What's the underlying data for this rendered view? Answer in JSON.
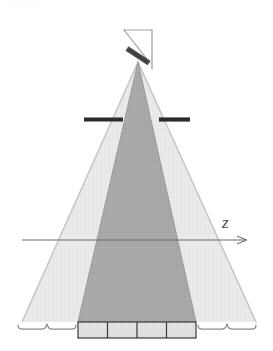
{
  "figure": {
    "name": "ultrasound-beam-geometry-diagram",
    "width": 273,
    "height": 351,
    "background_color": "#ffffff",
    "clipped_header_text": "............"
  },
  "axis": {
    "label": "z",
    "label_x": 222,
    "label_y": 228,
    "line_y": 240,
    "line_x_start": 22,
    "line_x_end": 246,
    "arrow_tip_x": 256,
    "color": "#6b6b6b",
    "stroke_width": 1.1
  },
  "source": {
    "name": "transducer-assembly",
    "bracket_color": "#9a9a9a",
    "bracket_stroke_width": 1.2,
    "diagonal_line": {
      "x1": 124,
      "y1": 30,
      "x2": 150,
      "y2": 62
    },
    "vertical_line": {
      "x1": 152,
      "y1": 30,
      "x2": 152,
      "y2": 69
    },
    "top_line": {
      "x1": 124,
      "y1": 30,
      "x2": 152,
      "y2": 30
    },
    "element_color": "#4d4d4d",
    "element": {
      "x1": 127,
      "y1": 49,
      "x2": 149,
      "y2": 63,
      "thickness": 5
    }
  },
  "beam": {
    "apex_x": 138,
    "apex_y": 62,
    "outer_cone": {
      "name": "outer-beam-cone",
      "fill_color": "#e8e8e8",
      "edge_color": "#c9c9c9",
      "left_x_bottom": 22,
      "right_x_bottom": 256,
      "bottom_y": 322
    },
    "inner_cone": {
      "name": "inner-beam-cone",
      "fill_color": "#a8a8a8",
      "edge_color": "#9a9a9a",
      "left_x_bottom": 78,
      "right_x_bottom": 196,
      "bottom_y": 322
    }
  },
  "aperture": {
    "name": "aperture-bars",
    "color": "#2b2b2b",
    "y": 119,
    "thickness": 4,
    "left_bar": {
      "x1": 84,
      "x2": 123
    },
    "right_bar": {
      "x1": 159,
      "x2": 190
    }
  },
  "detector_array": {
    "name": "detector-element-array",
    "x": 78,
    "y": 322,
    "width": 118,
    "height": 16,
    "cell_count": 4,
    "cell_fill": "#e0e0e0",
    "border_color": "#3a3a3a",
    "border_width": 1.1,
    "cells": [
      {
        "label": ""
      },
      {
        "label": ""
      },
      {
        "label": ""
      },
      {
        "label": ""
      }
    ]
  },
  "braces": [
    {
      "name": "left-brace",
      "x_start": 18,
      "x_end": 76,
      "y_top": 326,
      "tip_y": 348,
      "color": "#8a8a8a",
      "label": ""
    },
    {
      "name": "right-brace",
      "x_start": 198,
      "x_end": 256,
      "y_top": 326,
      "tip_y": 348,
      "color": "#8a8a8a",
      "label": ""
    }
  ]
}
